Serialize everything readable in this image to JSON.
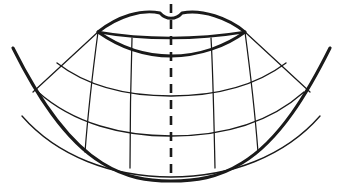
{
  "figure": {
    "canvas": {
      "width": 343,
      "height": 194,
      "background": "#ffffff"
    },
    "ink_color": "#1a1a1a",
    "line_weights": {
      "outer_boundary": 3.1,
      "upper_lip": 2.9,
      "lip_line": 2.4,
      "lower_lip": 2.9,
      "grid_arc": 1.35,
      "grid_radial": 1.25,
      "midline_axis": 2.6
    },
    "landmarks": {
      "left_commissure": {
        "x": 98,
        "y": 32
      },
      "right_commissure": {
        "x": 245,
        "y": 32
      },
      "cupids_bow_notch": {
        "x": 171,
        "y": 17
      },
      "lower_lip_lowest": {
        "x": 171,
        "y": 56
      },
      "chin_base_center": {
        "x": 171,
        "y": 177
      },
      "outer_left_top": {
        "x": 13,
        "y": 48
      },
      "outer_right_top": {
        "x": 330,
        "y": 48
      }
    },
    "midline_axis": {
      "style": "dashed",
      "dash_pattern": "9 7",
      "x": 171,
      "y_top": 4,
      "y_bottom": 181
    },
    "grid": {
      "arc_count": 5,
      "arc_center_y_values": [
        32,
        56,
        96,
        136,
        177
      ],
      "radial_count": 6,
      "radial_labels": [
        "outer-left",
        "left-mid",
        "left-inner",
        "right-inner",
        "right-mid",
        "outer-right"
      ]
    },
    "paths": {
      "upper_lip": "M 98 32 C 118 16, 142 9, 160 13 C 166 20, 176 20, 182 13 C 202 9, 228 18, 245 32",
      "lip_line": "M 98 32 C 126 37, 150 38, 171 38 C 194 38, 220 36, 245 32",
      "lower_lip": "M 98 32 C 118 46, 144 56, 171 56 C 199 56, 226 46, 245 32",
      "outer_boundary": "M 13 48 C 35 92, 64 140, 102 163 C 126 178, 148 181, 171 181 C 195 181, 218 178, 242 163 C 280 140, 308 92, 330 48",
      "arc_1": "M 98 32 C 126 37, 150 38, 171 38 C 194 38, 220 36, 245 32",
      "arc_2": "M 98 32 C 118 46, 144 56, 171 56 C 199 56, 226 46, 245 32",
      "arc_3": "M 57 63 C 88 87, 130 96, 171 96 C 213 96, 254 87, 286 63",
      "arc_4": "M 38 92 C 74 124, 123 136, 171 136 C 220 136, 268 124, 304 92",
      "arc_5": "M 22 116 C 57 156, 112 177, 171 177 C 231 177, 285 156, 320 116",
      "radial_outer_left": "M 98 32 L 33 92",
      "radial_left_mid": "M 98 32 C 94 62, 88 113, 85 152",
      "radial_left_inner": "M 132 38 C 131 70, 130 124, 130 168",
      "radial_right_inner": "M 211 38 C 213 70, 214 124, 215 168",
      "radial_right_mid": "M 245 32 C 249 62, 255 113, 258 152",
      "radial_outer_right": "M 245 32 L 310 92"
    }
  }
}
